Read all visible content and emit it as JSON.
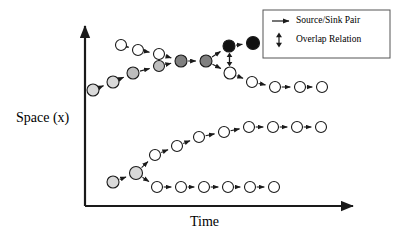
{
  "figure": {
    "title_absent": true,
    "background_color": "#ffffff",
    "width": 394,
    "height": 243
  },
  "axes": {
    "y_label": "Space (x)",
    "x_label": "Time",
    "line_color": "#1a1a1a",
    "y_axis": {
      "x": 85,
      "y_top": 20,
      "y_bottom": 206
    },
    "x_axis": {
      "y": 206,
      "x_left": 85,
      "x_right": 360
    }
  },
  "legend": {
    "box": {
      "x": 263,
      "y": 10,
      "width": 127,
      "height": 48
    },
    "border_color": "#555555",
    "items": [
      {
        "label": "Source/Sink Pair",
        "symbol": "right-arrow"
      },
      {
        "label": "Overlap Relation",
        "symbol": "vertical-double-arrow"
      }
    ]
  },
  "colors": {
    "node_white": "#ffffff",
    "node_light_gray": "#d9d9d9",
    "node_mid_gray": "#bdbdbd",
    "node_dark_gray": "#808080",
    "node_black": "#111111",
    "stroke": "#1a1a1a"
  },
  "chart_data": {
    "type": "diagram",
    "xlabel": "Time",
    "ylabel": "Space (x)",
    "nodes": [
      {
        "id": "n1",
        "x": 121,
        "y": 45,
        "r": 5.5,
        "fill": "node_white"
      },
      {
        "id": "n2",
        "x": 138,
        "y": 50,
        "r": 5.5,
        "fill": "node_white"
      },
      {
        "id": "n3",
        "x": 93,
        "y": 90,
        "r": 6.0,
        "fill": "node_light_gray"
      },
      {
        "id": "n4",
        "x": 113,
        "y": 82,
        "r": 6.0,
        "fill": "node_light_gray"
      },
      {
        "id": "n5",
        "x": 133,
        "y": 73,
        "r": 6.0,
        "fill": "node_mid_gray"
      },
      {
        "id": "ov_top",
        "x": 159,
        "y": 54,
        "r": 5.5,
        "fill": "node_white"
      },
      {
        "id": "ov_bot",
        "x": 159,
        "y": 66,
        "r": 5.5,
        "fill": "node_mid_gray"
      },
      {
        "id": "n6",
        "x": 181,
        "y": 61,
        "r": 6.0,
        "fill": "node_dark_gray"
      },
      {
        "id": "n7",
        "x": 206,
        "y": 61,
        "r": 6.0,
        "fill": "node_dark_gray"
      },
      {
        "id": "n8",
        "x": 229,
        "y": 46,
        "r": 6.0,
        "fill": "node_black"
      },
      {
        "id": "n9",
        "x": 253,
        "y": 43,
        "r": 6.5,
        "fill": "node_black"
      },
      {
        "id": "n10",
        "x": 230,
        "y": 73,
        "r": 6.0,
        "fill": "node_white"
      },
      {
        "id": "n11",
        "x": 252,
        "y": 82,
        "r": 5.5,
        "fill": "node_white"
      },
      {
        "id": "n12",
        "x": 275,
        "y": 87,
        "r": 5.5,
        "fill": "node_white"
      },
      {
        "id": "n13",
        "x": 300,
        "y": 87,
        "r": 5.5,
        "fill": "node_white"
      },
      {
        "id": "n14",
        "x": 322,
        "y": 87,
        "r": 5.5,
        "fill": "node_white"
      },
      {
        "id": "m1",
        "x": 113,
        "y": 182,
        "r": 6.0,
        "fill": "node_light_gray"
      },
      {
        "id": "m2",
        "x": 136,
        "y": 173,
        "r": 6.5,
        "fill": "node_light_gray"
      },
      {
        "id": "m3",
        "x": 155,
        "y": 155,
        "r": 5.5,
        "fill": "node_white"
      },
      {
        "id": "m4",
        "x": 177,
        "y": 146,
        "r": 5.5,
        "fill": "node_white"
      },
      {
        "id": "m5",
        "x": 199,
        "y": 137,
        "r": 5.5,
        "fill": "node_white"
      },
      {
        "id": "m6",
        "x": 224,
        "y": 132,
        "r": 5.5,
        "fill": "node_white"
      },
      {
        "id": "m7",
        "x": 249,
        "y": 127,
        "r": 5.5,
        "fill": "node_white"
      },
      {
        "id": "m8",
        "x": 273,
        "y": 127,
        "r": 5.5,
        "fill": "node_white"
      },
      {
        "id": "m9",
        "x": 297,
        "y": 127,
        "r": 5.5,
        "fill": "node_white"
      },
      {
        "id": "m10",
        "x": 321,
        "y": 127,
        "r": 5.5,
        "fill": "node_white"
      },
      {
        "id": "b1",
        "x": 157,
        "y": 187,
        "r": 5.5,
        "fill": "node_white"
      },
      {
        "id": "b2",
        "x": 181,
        "y": 187,
        "r": 5.5,
        "fill": "node_white"
      },
      {
        "id": "b3",
        "x": 204,
        "y": 187,
        "r": 5.5,
        "fill": "node_white"
      },
      {
        "id": "b4",
        "x": 228,
        "y": 187,
        "r": 5.5,
        "fill": "node_white"
      },
      {
        "id": "b5",
        "x": 250,
        "y": 187,
        "r": 5.5,
        "fill": "node_white"
      },
      {
        "id": "b6",
        "x": 274,
        "y": 187,
        "r": 5.5,
        "fill": "node_white"
      }
    ],
    "edges": [
      {
        "from": "n1",
        "to": "n2",
        "type": "arrow"
      },
      {
        "from": "n2",
        "to": "ov_top",
        "type": "arrow"
      },
      {
        "from": "n3",
        "to": "n4",
        "type": "arrow"
      },
      {
        "from": "n4",
        "to": "n5",
        "type": "arrow"
      },
      {
        "from": "n5",
        "to": "ov_bot",
        "type": "arrow"
      },
      {
        "from": "ov_top",
        "to": "n6",
        "type": "arrow"
      },
      {
        "from": "ov_bot",
        "to": "n6",
        "type": "arrow"
      },
      {
        "from": "n6",
        "to": "n7",
        "type": "arrow"
      },
      {
        "from": "n7",
        "to": "n8",
        "type": "arrow"
      },
      {
        "from": "n8",
        "to": "n9",
        "type": "arrow"
      },
      {
        "from": "n7",
        "to": "n10",
        "type": "arrow"
      },
      {
        "from": "n10",
        "to": "n11",
        "type": "arrow"
      },
      {
        "from": "n11",
        "to": "n12",
        "type": "arrow"
      },
      {
        "from": "n12",
        "to": "n13",
        "type": "arrow"
      },
      {
        "from": "n13",
        "to": "n14",
        "type": "arrow"
      },
      {
        "from": "m1",
        "to": "m2",
        "type": "arrow"
      },
      {
        "from": "m2",
        "to": "m3",
        "type": "arrow"
      },
      {
        "from": "m3",
        "to": "m4",
        "type": "arrow"
      },
      {
        "from": "m4",
        "to": "m5",
        "type": "arrow"
      },
      {
        "from": "m5",
        "to": "m6",
        "type": "arrow"
      },
      {
        "from": "m6",
        "to": "m7",
        "type": "arrow"
      },
      {
        "from": "m7",
        "to": "m8",
        "type": "arrow"
      },
      {
        "from": "m8",
        "to": "m9",
        "type": "arrow"
      },
      {
        "from": "m9",
        "to": "m10",
        "type": "arrow"
      },
      {
        "from": "m2",
        "to": "b1",
        "type": "arrow"
      },
      {
        "from": "b1",
        "to": "b2",
        "type": "arrow"
      },
      {
        "from": "b2",
        "to": "b3",
        "type": "arrow"
      },
      {
        "from": "b3",
        "to": "b4",
        "type": "arrow"
      },
      {
        "from": "b4",
        "to": "b5",
        "type": "arrow"
      },
      {
        "from": "b5",
        "to": "b6",
        "type": "arrow"
      }
    ],
    "overlap_relations": [
      {
        "upper": "ov_top",
        "lower": "ov_bot"
      },
      {
        "upper": "n8",
        "lower": "n10"
      }
    ]
  }
}
